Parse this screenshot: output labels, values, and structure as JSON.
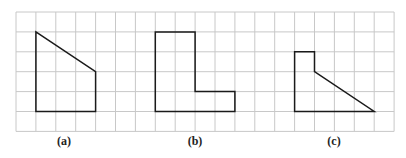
{
  "grid": {
    "origin_x": 16,
    "origin_y": 12,
    "cell": 19.9,
    "cols": 19,
    "rows": 6,
    "line_color": "#c8c8c8",
    "shape_color": "#1a1a1a"
  },
  "shapes": [
    {
      "id": "a",
      "label": "(a)",
      "label_x": 64,
      "points": [
        [
          1,
          1
        ],
        [
          4,
          3
        ],
        [
          4,
          5
        ],
        [
          1,
          5
        ]
      ]
    },
    {
      "id": "b",
      "label": "(b)",
      "label_x": 195,
      "points": [
        [
          7,
          1
        ],
        [
          9,
          1
        ],
        [
          9,
          4
        ],
        [
          11,
          4
        ],
        [
          11,
          5
        ],
        [
          7,
          5
        ]
      ]
    },
    {
      "id": "c",
      "label": "(c)",
      "label_x": 334,
      "points": [
        [
          14,
          2
        ],
        [
          15,
          2
        ],
        [
          15,
          3
        ],
        [
          18,
          5
        ],
        [
          14,
          5
        ]
      ]
    }
  ]
}
